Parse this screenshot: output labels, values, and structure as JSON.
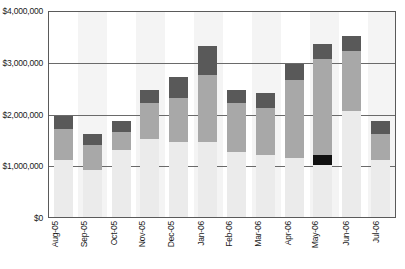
{
  "chart_data": {
    "type": "bar",
    "stacked": true,
    "title": "",
    "subtitle": "",
    "xlabel": "",
    "ylabel": "",
    "ylim": [
      0,
      4000000
    ],
    "ytick_values": [
      0,
      1000000,
      2000000,
      3000000,
      4000000
    ],
    "ytick_labels": [
      "$0",
      "$1,000,000",
      "$2,000,000",
      "$3,000,000",
      "$4,000,000"
    ],
    "grid": true,
    "grid_axis": "y",
    "legend": false,
    "legend_position": "none",
    "categories": [
      "Aug-05",
      "Sep-05",
      "Oct-05",
      "Nov-05",
      "Dec-05",
      "Jan-06",
      "Feb-06",
      "Mar-06",
      "Apr-06",
      "May-06",
      "Jun-06",
      "Jul-06"
    ],
    "series": [
      {
        "name": "segment-1-light",
        "color": "#ebebeb",
        "values": [
          1100000,
          900000,
          1300000,
          1500000,
          1450000,
          1450000,
          1250000,
          1200000,
          1150000,
          1000000,
          2050000,
          1100000
        ]
      },
      {
        "name": "segment-2-black",
        "color": "#111111",
        "values": [
          0,
          0,
          0,
          0,
          0,
          0,
          0,
          0,
          0,
          200000,
          0,
          0
        ]
      },
      {
        "name": "segment-3-medium",
        "color": "#a8a8a8",
        "values": [
          600000,
          500000,
          350000,
          700000,
          850000,
          1300000,
          950000,
          900000,
          1500000,
          1850000,
          1150000,
          500000
        ]
      },
      {
        "name": "segment-4-dark",
        "color": "#595959",
        "values": [
          250000,
          200000,
          200000,
          250000,
          400000,
          550000,
          250000,
          300000,
          300000,
          300000,
          300000,
          250000
        ]
      }
    ],
    "totals": [
      1950000,
      1600000,
      1850000,
      2450000,
      2700000,
      3300000,
      2450000,
      2400000,
      2950000,
      3350000,
      3500000,
      1850000
    ],
    "caption": ""
  },
  "axis": {
    "y_labels": [
      "$4,000,000",
      "$3,000,000",
      "$2,000,000",
      "$1,000,000",
      "$0"
    ]
  },
  "colors": {
    "plot_border": "#5a5a5a",
    "gridline": "#6a6a6a",
    "background": "#ffffff",
    "band": "#f4f4f4",
    "text": "#1b1b1b"
  }
}
